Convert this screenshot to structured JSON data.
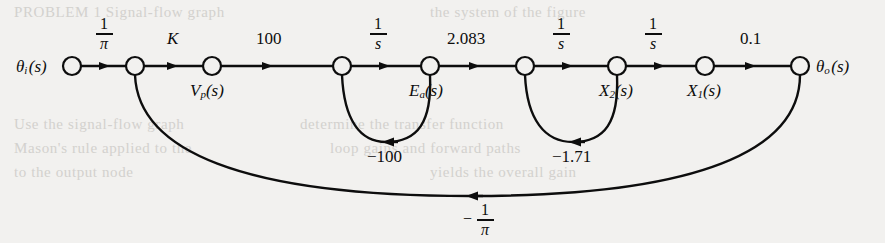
{
  "figure": {
    "background": "#f2f1ef",
    "ink": "#0d0d0d"
  },
  "nodes": [
    {
      "id": "theta_i",
      "label_main": "θ",
      "label_sub": "i",
      "label_tail": "(s)",
      "x": 72,
      "y": 66,
      "label_side": "left"
    },
    {
      "id": "n2",
      "label_main": "",
      "label_sub": "",
      "label_tail": "",
      "x": 135,
      "y": 66,
      "label_side": "none"
    },
    {
      "id": "Vp",
      "label_main": "V",
      "label_sub": "p",
      "label_tail": "(s)",
      "x": 212,
      "y": 66,
      "label_side": "below"
    },
    {
      "id": "n4",
      "label_main": "",
      "label_sub": "",
      "label_tail": "",
      "x": 342,
      "y": 66,
      "label_side": "none"
    },
    {
      "id": "Ea",
      "label_main": "E",
      "label_sub": "a",
      "label_tail": "(s)",
      "x": 430,
      "y": 66,
      "label_side": "below"
    },
    {
      "id": "n6",
      "label_main": "",
      "label_sub": "",
      "label_tail": "",
      "x": 525,
      "y": 66,
      "label_side": "none"
    },
    {
      "id": "X2",
      "label_main": "X",
      "label_sub": "2",
      "label_tail": "(s)",
      "x": 617,
      "y": 66,
      "label_side": "below"
    },
    {
      "id": "X1",
      "label_main": "X",
      "label_sub": "1",
      "label_tail": "(s)",
      "x": 705,
      "y": 66,
      "label_side": "below"
    },
    {
      "id": "theta_o",
      "label_main": "θ",
      "label_sub": "o",
      "label_tail": "(s)",
      "x": 800,
      "y": 66,
      "label_side": "right"
    }
  ],
  "forward_branches": [
    {
      "from": "theta_i",
      "to": "n2",
      "gain_type": "fraction",
      "numerator": "1",
      "denominator": "π",
      "gain_text": "1/π"
    },
    {
      "from": "n2",
      "to": "Vp",
      "gain_type": "text",
      "gain_text": "K",
      "italic": true
    },
    {
      "from": "Vp",
      "to": "n4",
      "gain_type": "text",
      "gain_text": "100",
      "italic": false
    },
    {
      "from": "n4",
      "to": "Ea",
      "gain_type": "fraction",
      "numerator": "1",
      "denominator": "s",
      "gain_text": "1/s"
    },
    {
      "from": "Ea",
      "to": "n6",
      "gain_type": "text",
      "gain_text": "2.083",
      "italic": false
    },
    {
      "from": "n6",
      "to": "X2",
      "gain_type": "fraction",
      "numerator": "1",
      "denominator": "s",
      "gain_text": "1/s"
    },
    {
      "from": "X2",
      "to": "X1",
      "gain_type": "fraction",
      "numerator": "1",
      "denominator": "s",
      "gain_text": "1/s"
    },
    {
      "from": "X1",
      "to": "theta_o",
      "gain_type": "text",
      "gain_text": "0.1",
      "italic": false
    }
  ],
  "feedback_branches": [
    {
      "from": "Ea",
      "to": "n4",
      "gain_text": "−100",
      "shape": "small-loop"
    },
    {
      "from": "X2",
      "to": "n6",
      "gain_text": "−1.71",
      "shape": "small-loop"
    },
    {
      "from": "theta_o",
      "to": "n2",
      "gain_type": "fraction",
      "numerator": "1",
      "denominator": "π",
      "sign": "−",
      "gain_text": "−1/π",
      "shape": "large-arc"
    }
  ],
  "bleed_text": [
    {
      "text": "PROBLEM 1 Signal-flow graph",
      "x": 14,
      "y": 6
    },
    {
      "text": "the system of the figure",
      "x": 430,
      "y": 6
    },
    {
      "text": "Use the signal-flow graph",
      "x": 14,
      "y": 118
    },
    {
      "text": "determine the transfer function",
      "x": 300,
      "y": 118
    },
    {
      "text": "Mason's rule applied to the",
      "x": 14,
      "y": 142
    },
    {
      "text": "loop gains and forward paths",
      "x": 330,
      "y": 142
    },
    {
      "text": "to the output node",
      "x": 14,
      "y": 166
    },
    {
      "text": "yields the overall gain",
      "x": 430,
      "y": 166
    }
  ]
}
